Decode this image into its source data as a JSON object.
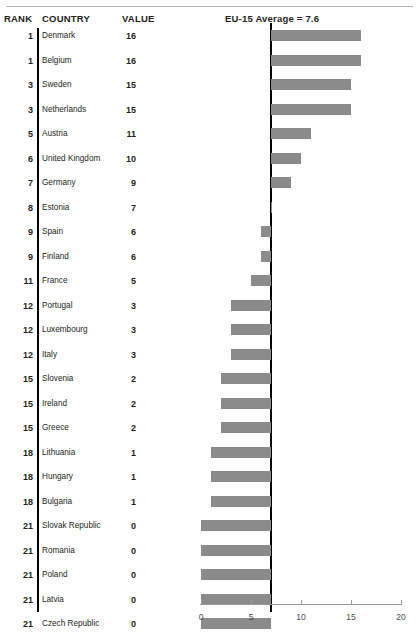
{
  "header": {
    "rank_label": "RANK",
    "country_label": "COUNTRY",
    "value_label": "VALUE",
    "average_label": "EU-15 Average = 7.6"
  },
  "chart_data": {
    "type": "bar",
    "orientation": "horizontal",
    "title": "",
    "subtitle": "",
    "xlabel": "",
    "ylabel": "",
    "xlim": [
      0,
      20
    ],
    "xticks": [
      0,
      5,
      10,
      15,
      20
    ],
    "xtick_labels": [
      "0",
      "5",
      "10",
      "15",
      "20"
    ],
    "grid": false,
    "legend": null,
    "reference_line": {
      "label": "EU-15 Average = 7.6",
      "value": 7.6
    },
    "bar_color": "#8b8b8b",
    "categories": [
      "Denmark",
      "Belgium",
      "Sweden",
      "Netherlands",
      "Austria",
      "United Kingdom",
      "Germany",
      "Estonia",
      "Spain",
      "Finland",
      "France",
      "Portugal",
      "Luxembourg",
      "Italy",
      "Slovenia",
      "Ireland",
      "Greece",
      "Lithuania",
      "Hungary",
      "Bulgaria",
      "Slovak Republic",
      "Romania",
      "Poland",
      "Latvia",
      "Czech Republic"
    ],
    "values": [
      16,
      16,
      15,
      15,
      11,
      10,
      9,
      7,
      6,
      6,
      5,
      3,
      3,
      3,
      2,
      2,
      2,
      1,
      1,
      1,
      0,
      0,
      0,
      0,
      0
    ],
    "ranks": [
      1,
      1,
      3,
      3,
      5,
      6,
      7,
      8,
      9,
      9,
      11,
      12,
      12,
      12,
      15,
      15,
      15,
      18,
      18,
      18,
      21,
      21,
      21,
      21,
      21
    ]
  },
  "rows": [
    {
      "rank": "1",
      "country": "Denmark",
      "value": "16"
    },
    {
      "rank": "1",
      "country": "Belgium",
      "value": "16"
    },
    {
      "rank": "3",
      "country": "Sweden",
      "value": "15"
    },
    {
      "rank": "3",
      "country": "Netherlands",
      "value": "15"
    },
    {
      "rank": "5",
      "country": "Austria",
      "value": "11"
    },
    {
      "rank": "6",
      "country": "United Kingdom",
      "value": "10"
    },
    {
      "rank": "7",
      "country": "Germany",
      "value": "9"
    },
    {
      "rank": "8",
      "country": "Estonia",
      "value": "7"
    },
    {
      "rank": "9",
      "country": "Spain",
      "value": "6"
    },
    {
      "rank": "9",
      "country": "Finland",
      "value": "6"
    },
    {
      "rank": "11",
      "country": "France",
      "value": "5"
    },
    {
      "rank": "12",
      "country": "Portugal",
      "value": "3"
    },
    {
      "rank": "12",
      "country": "Luxembourg",
      "value": "3"
    },
    {
      "rank": "12",
      "country": "Italy",
      "value": "3"
    },
    {
      "rank": "15",
      "country": "Slovenia",
      "value": "2"
    },
    {
      "rank": "15",
      "country": "Ireland",
      "value": "2"
    },
    {
      "rank": "15",
      "country": "Greece",
      "value": "2"
    },
    {
      "rank": "18",
      "country": "Lithuania",
      "value": "1"
    },
    {
      "rank": "18",
      "country": "Hungary",
      "value": "1"
    },
    {
      "rank": "18",
      "country": "Bulgaria",
      "value": "1"
    },
    {
      "rank": "21",
      "country": "Slovak Republic",
      "value": "0"
    },
    {
      "rank": "21",
      "country": "Romania",
      "value": "0"
    },
    {
      "rank": "21",
      "country": "Poland",
      "value": "0"
    },
    {
      "rank": "21",
      "country": "Latvia",
      "value": "0"
    },
    {
      "rank": "21",
      "country": "Czech Republic",
      "value": "0"
    }
  ]
}
